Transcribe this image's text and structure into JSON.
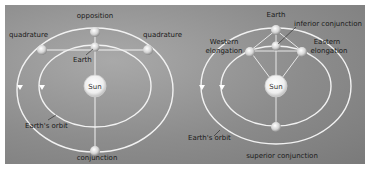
{
  "diagrams": [
    {
      "name": "superior-planet",
      "labels": {
        "opposition": "opposition",
        "quadrature_left": "quadrature",
        "quadrature_right": "quadrature",
        "earth": "Earth",
        "sun": "Sun",
        "earths_orbit": "Earth's orbit",
        "conjunction": "conjunction"
      }
    },
    {
      "name": "inferior-planet",
      "labels": {
        "earth": "Earth",
        "inferior_conjunction": "inferior conjunction",
        "western_elongation_1": "Western",
        "western_elongation_2": "elongation",
        "eastern_elongation_1": "Eastern",
        "eastern_elongation_2": "elongation",
        "sun": "Sun",
        "earths_orbit": "Earth's orbit",
        "superior_conjunction": "superior conjunction"
      }
    }
  ],
  "colors": {
    "background": "#8f8f8f",
    "orbit": "#f2f2f2",
    "text": "#1a1a1a"
  }
}
